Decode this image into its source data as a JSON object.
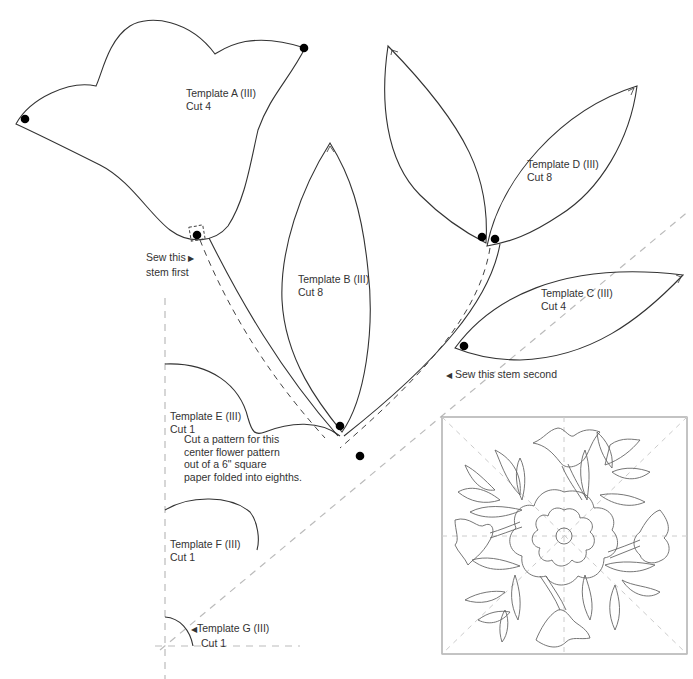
{
  "templates": [
    {
      "id": "A",
      "name": "Template A (III)",
      "cut": "Cut 4"
    },
    {
      "id": "B",
      "name": "Template B (III)",
      "cut": "Cut 8"
    },
    {
      "id": "C",
      "name": "Template C (III)",
      "cut": "Cut 4"
    },
    {
      "id": "D",
      "name": "Template D (III)",
      "cut": "Cut 8"
    },
    {
      "id": "E",
      "name": "Template E (III)",
      "cut": "Cut 1"
    },
    {
      "id": "F",
      "name": "Template F (III)",
      "cut": "Cut 1"
    },
    {
      "id": "G",
      "name": "Template G (III)",
      "cut": "Cut 1"
    }
  ],
  "notes": {
    "stem_first": [
      "Sew this",
      "stem first"
    ],
    "stem_second": "Sew this stem second",
    "center_instructions": [
      "Cut a pattern for this",
      "center flower pattern",
      "out of a 6\" square",
      "paper folded into eighths."
    ]
  },
  "colors": {
    "outline": "#333333",
    "guide_dash": "#bbbbbb",
    "stem_dash": "#444444",
    "dot": "#000000"
  }
}
